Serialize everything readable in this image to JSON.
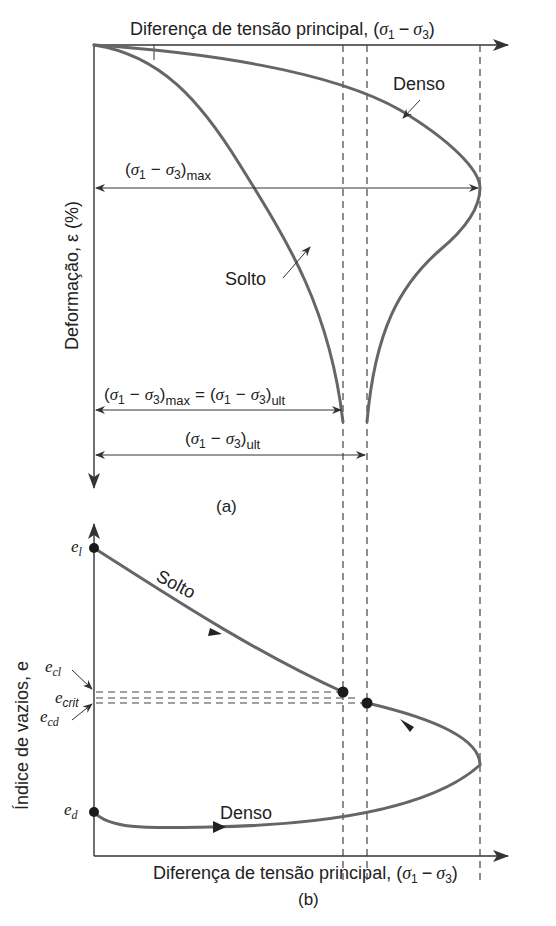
{
  "panel_a": {
    "x_axis_label": "Diferença de tensão principal, (σ₁ − σ₃)",
    "x_axis_label_prefix": "Diferença de tensão principal, (",
    "y_axis_label": "Deformação, ε (%)",
    "curve_labels": {
      "dense": "Denso",
      "loose": "Solto"
    },
    "dimensions": {
      "max": "(σ₁ − σ₃)max",
      "max_eq_ult": "(σ₁ − σ₃)max = (σ₁ − σ₃)ult",
      "ult": "(σ₁ − σ₃)ult"
    },
    "caption": "(a)"
  },
  "panel_b": {
    "x_axis_label": "Diferença de tensão principal, (σ₁ − σ₃)",
    "x_axis_label_prefix": "Diferença de tensão principal, (",
    "y_axis_label": "Índice de vazios, e",
    "curve_labels": {
      "dense": "Denso",
      "loose": "Solto"
    },
    "void_ratio_labels": {
      "e_l": "e",
      "e_l_sub": "l",
      "e_cl": "e",
      "e_cl_sub": "cl",
      "e_crit": "e",
      "e_crit_sub": "crit",
      "e_cd": "e",
      "e_cd_sub": "cd",
      "e_d": "e",
      "e_d_sub": "d"
    },
    "caption": "(b)"
  },
  "symbols": {
    "sigma": "σ",
    "sub1": "1",
    "sub3": "3",
    "minus": "−",
    "equals": "=",
    "sub_max": "max",
    "sub_ult": "ult"
  },
  "colors": {
    "curve": "#666666",
    "axis": "#333333",
    "text": "#222222"
  }
}
